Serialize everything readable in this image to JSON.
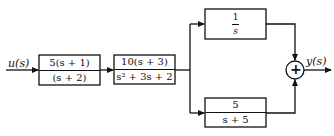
{
  "diagram": {
    "type": "block-diagram",
    "input_label": "u(s)",
    "output_label": "y(s)",
    "blocks": [
      {
        "id": "G1",
        "numerator": "5(s + 1)",
        "denominator": "(s + 2)"
      },
      {
        "id": "G2",
        "numerator": "10(s + 3)",
        "denominator": "s² + 3s + 2"
      },
      {
        "id": "G3",
        "numerator": "1",
        "denominator": "s"
      },
      {
        "id": "G4",
        "numerator": "5",
        "denominator": "s + 5"
      }
    ],
    "summing_junction": {
      "symbol": "+",
      "inputs": [
        "G3",
        "G4"
      ]
    },
    "connections": [
      "u(s) -> G1",
      "G1 -> G2",
      "G2 -> G3",
      "G2 -> G4",
      "G3 -> sum",
      "G4 -> sum",
      "sum -> y(s)"
    ]
  }
}
